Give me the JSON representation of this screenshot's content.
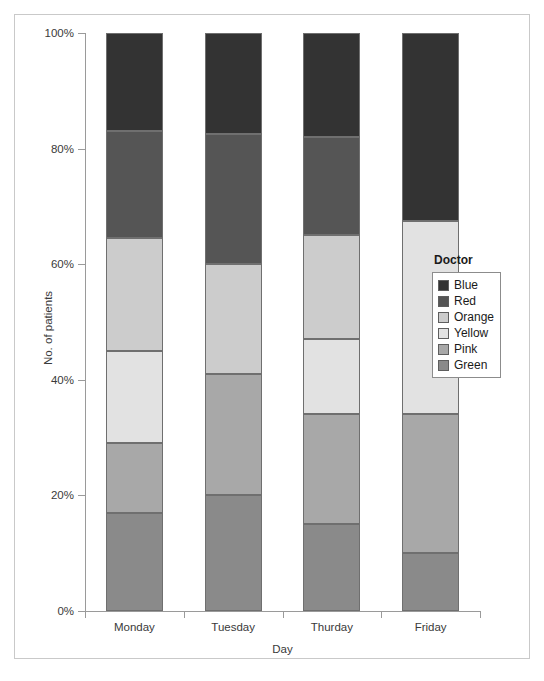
{
  "chart_data": {
    "type": "bar",
    "subtype": "stacked-percentage",
    "title": "",
    "xlabel": "Day",
    "ylabel": "No. of patients",
    "categories": [
      "Monday",
      "Tuesday",
      "Thurday",
      "Friday"
    ],
    "ylim": [
      0,
      100
    ],
    "ytick_labels": [
      "0%",
      "20%",
      "40%",
      "60%",
      "80%",
      "100%"
    ],
    "ytick_values": [
      0,
      20,
      40,
      60,
      80,
      100
    ],
    "grid": false,
    "legend_position": "right",
    "legend_title": "Doctor",
    "stack_order_bottom_to_top": [
      "Green",
      "Pink",
      "Yellow",
      "Orange",
      "Red",
      "Blue"
    ],
    "series": [
      {
        "name": "Blue",
        "color": "#333333",
        "values": [
          17.0,
          17.5,
          18.0,
          32.5
        ]
      },
      {
        "name": "Red",
        "color": "#555555",
        "values": [
          18.5,
          22.5,
          17.0,
          0.0
        ]
      },
      {
        "name": "Orange",
        "color": "#cccccc",
        "values": [
          19.5,
          19.0,
          18.0,
          0.0
        ]
      },
      {
        "name": "Yellow",
        "color": "#e2e2e2",
        "values": [
          16.0,
          0.0,
          13.0,
          33.5
        ]
      },
      {
        "name": "Pink",
        "color": "#a8a8a8",
        "values": [
          12.0,
          21.0,
          19.0,
          24.0
        ]
      },
      {
        "name": "Green",
        "color": "#8a8a8a",
        "values": [
          17.0,
          20.0,
          15.0,
          10.0
        ]
      }
    ],
    "stack_boundaries_percent": {
      "Monday": [
        0,
        17.0,
        29.0,
        45.0,
        64.5,
        83.0,
        100.0
      ],
      "Tuesday": [
        0,
        20.0,
        41.0,
        60.0,
        60.0,
        82.5,
        100.0
      ],
      "Thurday": [
        0,
        15.0,
        34.0,
        47.0,
        65.0,
        82.0,
        100.0
      ],
      "Friday": [
        0,
        10.0,
        34.0,
        67.5,
        67.5,
        67.5,
        100.0
      ]
    }
  },
  "axes": {
    "y_title": "No. of patients",
    "x_title": "Day",
    "y_ticks": [
      {
        "label": "100%",
        "value": 100
      },
      {
        "label": "80%",
        "value": 80
      },
      {
        "label": "60%",
        "value": 60
      },
      {
        "label": "40%",
        "value": 40
      },
      {
        "label": "20%",
        "value": 20
      },
      {
        "label": "0%",
        "value": 0
      }
    ],
    "x_ticks": [
      {
        "label": "Monday"
      },
      {
        "label": "Tuesday"
      },
      {
        "label": "Thurday"
      },
      {
        "label": "Friday"
      }
    ]
  },
  "legend": {
    "title": "Doctor",
    "items": [
      {
        "label": "Blue",
        "swatch": "#333333"
      },
      {
        "label": "Red",
        "swatch": "#555555"
      },
      {
        "label": "Orange",
        "swatch": "#cccccc"
      },
      {
        "label": "Yellow",
        "swatch": "#e2e2e2"
      },
      {
        "label": "Pink",
        "swatch": "#a8a8a8"
      },
      {
        "label": "Green",
        "swatch": "#8a8a8a"
      }
    ]
  }
}
